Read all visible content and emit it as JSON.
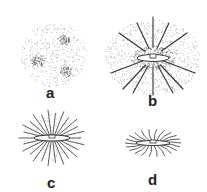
{
  "panels": [
    {
      "id": "a",
      "label": "a",
      "description": "diffuse stippled cloud with three dense clusters"
    },
    {
      "id": "b",
      "label": "b",
      "description": "spindle with long radiating lines in stippled halo"
    },
    {
      "id": "c",
      "label": "c",
      "description": "spindle with many radiating lines, sparse stipple"
    },
    {
      "id": "d",
      "label": "d",
      "description": "small spindle with short curved radiating lines"
    }
  ],
  "colors": {
    "ink": "#333333",
    "stipple": "#555555",
    "background": "#ffffff"
  }
}
